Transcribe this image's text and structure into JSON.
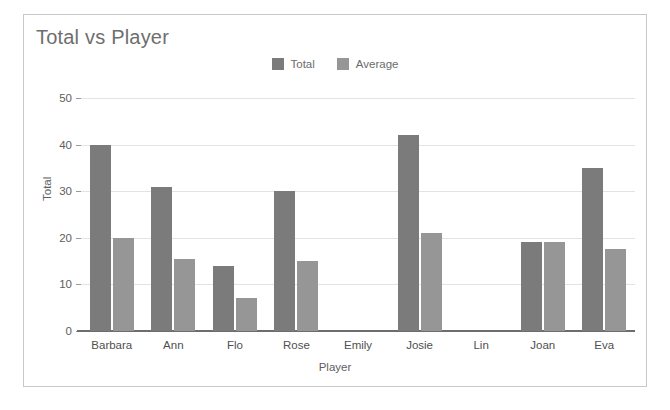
{
  "chart_data": {
    "type": "bar",
    "title": "Total vs Player",
    "xlabel": "Player",
    "ylabel": "Total",
    "categories": [
      "Barbara",
      "Ann",
      "Flo",
      "Rose",
      "Emily",
      "Josie",
      "Lin",
      "Joan",
      "Eva"
    ],
    "series": [
      {
        "name": "Total",
        "color": "#7b7b7b",
        "values": [
          40,
          31,
          14,
          30,
          0,
          42,
          0,
          19,
          35
        ]
      },
      {
        "name": "Average",
        "color": "#969696",
        "values": [
          20,
          15.5,
          7,
          15,
          0,
          21,
          0,
          19,
          17.5
        ]
      }
    ],
    "ylim": [
      0,
      50
    ],
    "yticks": [
      0,
      10,
      20,
      30,
      40,
      50
    ],
    "grid": true,
    "legend_position": "top-center"
  },
  "card": {
    "border_color": "#c8c8c8",
    "background": "#ffffff"
  }
}
